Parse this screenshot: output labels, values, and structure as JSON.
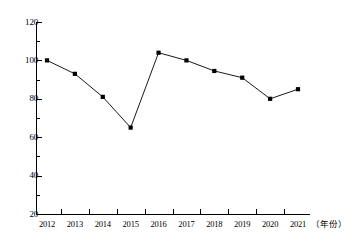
{
  "chart_data": {
    "type": "line",
    "title": "",
    "subtitle": "",
    "xlabel": "（年份）",
    "ylabel": "",
    "categories": [
      "2012",
      "2013",
      "2014",
      "2015",
      "2016",
      "2017",
      "2018",
      "2019",
      "2020",
      "2021"
    ],
    "values": [
      100,
      93,
      81,
      65,
      104,
      100,
      94.5,
      91,
      80,
      85
    ],
    "series": [
      {
        "name": "",
        "values": [
          100,
          93,
          81,
          65,
          104,
          100,
          94.5,
          91,
          80,
          85
        ]
      }
    ],
    "ylim": [
      20,
      120
    ],
    "ytick_major": [
      20,
      40,
      60,
      80,
      100,
      120
    ],
    "ytick_major_labels": [
      "20",
      "40",
      "60",
      "80",
      "100",
      "120"
    ],
    "ytick_minor": [
      30,
      50,
      70,
      90,
      110
    ],
    "grid": false,
    "legend": false,
    "legend_position": "none",
    "marker": "square",
    "marker_color": "#000000",
    "line_color": "#000000",
    "background_color": "#ffffff",
    "axis_color": "#000000"
  }
}
